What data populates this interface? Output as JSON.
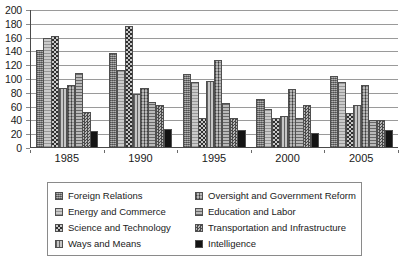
{
  "chart_data": {
    "type": "bar",
    "title": "",
    "subtitle": "",
    "xlabel": "",
    "ylabel": "",
    "categories": [
      "1985",
      "1990",
      "1995",
      "2000",
      "2005"
    ],
    "tick_labels": [
      "1985",
      "1990",
      "1995",
      "2000",
      "2005"
    ],
    "ylim": [
      0,
      200
    ],
    "ytick_values": [
      0,
      20,
      40,
      60,
      80,
      100,
      120,
      140,
      160,
      180,
      200
    ],
    "ytick_labels": [
      "0",
      "20",
      "40",
      "60",
      "80",
      "100",
      "120",
      "140",
      "160",
      "180",
      "200"
    ],
    "grid": true,
    "grid_axis": "y",
    "legend_position": "bottom",
    "legend_columns": 2,
    "series": [
      {
        "name": "Foreign Relations",
        "pattern": "fine-crosshatch-gray",
        "color": "#8e8e8e",
        "values": [
          142,
          137,
          107,
          71,
          104
        ]
      },
      {
        "name": "Energy and Commerce",
        "pattern": "light-horizontal-lines",
        "color": "#b4b4b4",
        "values": [
          159,
          113,
          95,
          56,
          95
        ]
      },
      {
        "name": "Science and Technology",
        "pattern": "checkerboard-dark",
        "color": "#707070",
        "values": [
          162,
          177,
          43,
          44,
          51
        ]
      },
      {
        "name": "Ways and Means",
        "pattern": "vertical-lines",
        "color": "#a8a8a8",
        "values": [
          87,
          79,
          97,
          47,
          62
        ]
      },
      {
        "name": "Oversight and Government Reform",
        "pattern": "dense-grid",
        "color": "#8c8c8c",
        "values": [
          92,
          87,
          127,
          85,
          92
        ]
      },
      {
        "name": "Education and Labor",
        "pattern": "horizontal-lines",
        "color": "#9e9e9e",
        "values": [
          109,
          67,
          65,
          44,
          41
        ]
      },
      {
        "name": "Transportation and Infrastructure",
        "pattern": "fine-checker",
        "color": "#7d7d7d",
        "values": [
          52,
          63,
          44,
          62,
          40
        ]
      },
      {
        "name": "Intelligence",
        "pattern": "solid-black",
        "color": "#141414",
        "values": [
          24,
          28,
          26,
          22,
          26
        ]
      }
    ]
  },
  "legend": {
    "items": [
      {
        "label": "Foreign Relations",
        "swatch_class": "p-foreign-relations"
      },
      {
        "label": "Energy and Commerce",
        "swatch_class": "p-energy-commerce"
      },
      {
        "label": "Science and Technology",
        "swatch_class": "p-science-technology"
      },
      {
        "label": "Ways and Means",
        "swatch_class": "p-ways-means"
      },
      {
        "label": "Oversight and Government Reform",
        "swatch_class": "p-oversight-reform"
      },
      {
        "label": "Education and Labor",
        "swatch_class": "p-education-labor"
      },
      {
        "label": "Transportation and Infrastructure",
        "swatch_class": "p-transportation-infrastructure"
      },
      {
        "label": "Intelligence",
        "swatch_class": "p-intelligence"
      }
    ]
  }
}
